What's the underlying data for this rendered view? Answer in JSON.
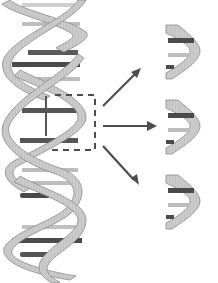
{
  "diagram": {
    "title": "",
    "colors": {
      "strand_fill": "#c8c8c8",
      "strand_stroke": "#8a8a8a",
      "base_dark": "#4a4a4a",
      "base_light": "#bdbdbd",
      "arrow": "#4d4d4d",
      "dashed_box": "#4d4d4d"
    },
    "elements": {
      "helix": {
        "label": ""
      },
      "selection_box": {
        "label": ""
      },
      "arrows": [
        {
          "label": "",
          "direction": "up-right"
        },
        {
          "label": "",
          "direction": "right"
        },
        {
          "label": "",
          "direction": "down-right"
        }
      ],
      "fragments": [
        {
          "label": ""
        },
        {
          "label": ""
        },
        {
          "label": ""
        }
      ]
    }
  }
}
